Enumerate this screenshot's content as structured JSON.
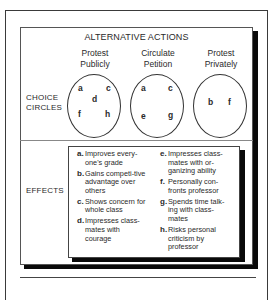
{
  "diagram": {
    "title": "ALTERNATIVE ACTIONS",
    "row_labels": {
      "choice_circles": [
        "CHOICE",
        "CIRCLES"
      ],
      "effects": "EFFECTS"
    },
    "actions": [
      {
        "label": [
          "Protest",
          "Publicly"
        ],
        "letters": [
          "a",
          "c",
          "d",
          "f",
          "h"
        ]
      },
      {
        "label": [
          "Circulate",
          "Petition"
        ],
        "letters": [
          "a",
          "c",
          "e",
          "g"
        ]
      },
      {
        "label": [
          "Protest",
          "Privately"
        ],
        "letters": [
          "b",
          "f"
        ]
      }
    ],
    "effects": [
      {
        "key": "a.",
        "text": "Improves every-one's grade"
      },
      {
        "key": "b.",
        "text": "Gains competi-tive advantage over others"
      },
      {
        "key": "c.",
        "text": "Shows concern for whole class"
      },
      {
        "key": "d.",
        "text": "Impresses class-mates with courage"
      },
      {
        "key": "e.",
        "text": "Impresses class-mates with or-ganizing ability"
      },
      {
        "key": "f.",
        "text": "Personally con-fronts professor"
      },
      {
        "key": "g.",
        "text": "Spends time talk-ing with class-mates"
      },
      {
        "key": "h.",
        "text": "Risks personal criticism by professor"
      }
    ]
  }
}
